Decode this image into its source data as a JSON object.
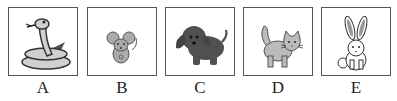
{
  "options": [
    {
      "letter": "A",
      "animal": "snake",
      "icon": "snake-icon",
      "x": 8
    },
    {
      "letter": "B",
      "animal": "mouse",
      "icon": "mouse-icon",
      "x": 87
    },
    {
      "letter": "C",
      "animal": "dog",
      "icon": "dog-icon",
      "x": 165
    },
    {
      "letter": "D",
      "animal": "cat",
      "icon": "cat-icon",
      "x": 243
    },
    {
      "letter": "E",
      "animal": "rabbit",
      "icon": "rabbit-icon",
      "x": 321
    }
  ],
  "colors": {
    "border": "#555555",
    "outline": "#333333",
    "light_gray": "#c8c8c8",
    "mid_gray": "#999999",
    "dark_gray": "#505050"
  }
}
